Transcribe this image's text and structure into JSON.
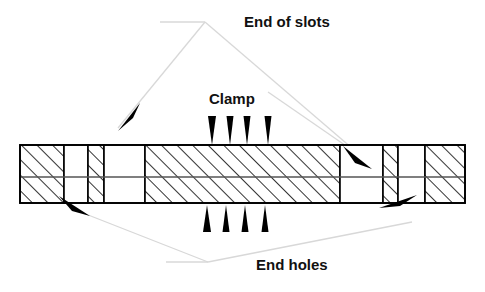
{
  "diagram": {
    "title_labels": {
      "end_of_slots": "End of slots",
      "clamp": "Clamp",
      "end_holes": "End holes"
    },
    "colors": {
      "outline": "#000000",
      "hatch": "#000000",
      "leader_line": "#d8d8d8",
      "arrow_fill": "#000000",
      "background": "#ffffff",
      "text": "#111111",
      "interior_line": "#555555"
    },
    "bar": {
      "x": 20,
      "y": 145,
      "width": 445,
      "height": 58,
      "midline_y": 177
    },
    "segments": [
      {
        "name": "left-end-hatched-block",
        "x": 20,
        "width": 44,
        "fill": "hatched"
      },
      {
        "name": "left-slot-gap",
        "x": 64,
        "width": 24,
        "fill": "white"
      },
      {
        "name": "left-narrow-hatch-strip",
        "x": 88,
        "width": 16,
        "fill": "hatched"
      },
      {
        "name": "left-inner-slot-gap",
        "x": 104,
        "width": 41,
        "fill": "white"
      },
      {
        "name": "clamp-block",
        "x": 145,
        "width": 195,
        "fill": "hatched"
      },
      {
        "name": "right-inner-slot-gap",
        "x": 340,
        "width": 43,
        "fill": "white"
      },
      {
        "name": "right-narrow-hatch-strip",
        "x": 383,
        "width": 15,
        "fill": "hatched"
      },
      {
        "name": "right-slot-gap",
        "x": 398,
        "width": 27,
        "fill": "white"
      },
      {
        "name": "right-end-hatched-block",
        "x": 425,
        "width": 40,
        "fill": "hatched"
      }
    ],
    "clamp_arrows_top": [
      {
        "x": 212,
        "tip_y": 145,
        "tail_y": 116
      },
      {
        "x": 230,
        "tip_y": 145,
        "tail_y": 116
      },
      {
        "x": 247,
        "tip_y": 145,
        "tail_y": 116
      },
      {
        "x": 268,
        "tip_y": 145,
        "tail_y": 116
      }
    ],
    "clamp_arrows_bottom": [
      {
        "x": 207,
        "tip_y": 205,
        "tail_y": 232
      },
      {
        "x": 226,
        "tip_y": 205,
        "tail_y": 232
      },
      {
        "x": 245,
        "tip_y": 205,
        "tail_y": 232
      },
      {
        "x": 265,
        "tip_y": 205,
        "tail_y": 232
      }
    ],
    "leaders": {
      "end_of_slots": {
        "label_x": 244,
        "label_y": 23,
        "apex": {
          "x": 205,
          "y": 22
        },
        "stem_from": {
          "x": 160,
          "y": 22
        },
        "dart_left": {
          "x": 122,
          "y": 123,
          "angle": 56
        },
        "dart_right": {
          "x": 352,
          "y": 149,
          "angle": 128
        }
      },
      "clamp": {
        "label_x": 209,
        "label_y": 100
      },
      "end_holes": {
        "label_x": 256,
        "label_y": 266,
        "apex": {
          "x": 208,
          "y": 262
        },
        "stem_from": {
          "x": 166,
          "y": 262
        },
        "dart_left": {
          "x": 82,
          "y": 208,
          "angle": 126
        },
        "dart_right": {
          "x": 400,
          "y": 223,
          "angle": 190
        }
      }
    }
  }
}
